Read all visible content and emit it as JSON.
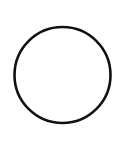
{
  "shape": {
    "type": "circle",
    "icon": "circle-outline-icon",
    "cx": 62.5,
    "cy": 75,
    "r": 48,
    "stroke_color": "#111111",
    "stroke_width": 2.6,
    "fill": "#ffffff"
  },
  "background_color": "#ffffff"
}
